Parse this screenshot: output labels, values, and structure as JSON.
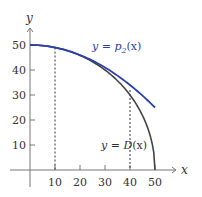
{
  "chart_data": {
    "type": "line",
    "title": "",
    "xlabel": "x",
    "ylabel": "y",
    "xlim": [
      -5,
      60
    ],
    "ylim": [
      -10,
      60
    ],
    "grid": false,
    "x_ticks": [
      10,
      20,
      30,
      40,
      50
    ],
    "y_ticks": [
      10,
      20,
      30,
      40,
      50
    ],
    "x_tick_labels": [
      "10",
      "20",
      "30",
      "40",
      "50"
    ],
    "y_tick_labels": [
      "10",
      "20",
      "30",
      "40",
      "50"
    ],
    "series": [
      {
        "name": "y = p₂(x)",
        "color": "#2a3fb0",
        "x": [
          0,
          10,
          20,
          30,
          40,
          50
        ],
        "values": [
          50,
          49,
          46,
          41,
          34,
          25
        ]
      },
      {
        "name": "y = D(x)",
        "color": "#444444",
        "x": [
          0,
          10,
          20,
          30,
          40,
          45,
          48,
          50
        ],
        "values": [
          50,
          49,
          45.8,
          40,
          30,
          21.8,
          14,
          0
        ]
      }
    ],
    "annotations": [
      {
        "type": "dashed-vertical",
        "x": 10,
        "y_top": 49
      },
      {
        "type": "dashed-vertical",
        "x": 40,
        "y_top": 32
      }
    ],
    "labels": {
      "p2": {
        "prefix": "y = ",
        "fn": "p",
        "sub": "2",
        "arg": "(x)"
      },
      "d": {
        "prefix": "y = ",
        "fn": "D",
        "arg": "(x)"
      }
    }
  }
}
